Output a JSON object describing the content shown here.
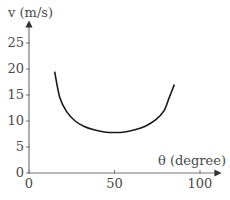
{
  "chart_data": {
    "type": "line",
    "title": "",
    "xlabel": "θ (degree)",
    "ylabel": "v (m/s)",
    "xlim": [
      0,
      100
    ],
    "ylim": [
      0,
      28
    ],
    "x_ticks": [
      "0",
      "50",
      "100"
    ],
    "y_ticks": [
      "0",
      "5",
      "10",
      "15",
      "20",
      "25"
    ],
    "grid": false,
    "legend": null,
    "series": [
      {
        "name": "v vs θ",
        "x": [
          15,
          18,
          22,
          27,
          32,
          38,
          44,
          50,
          56,
          62,
          68,
          74,
          79,
          82,
          85
        ],
        "y": [
          19.5,
          14.5,
          11.8,
          10.0,
          9.0,
          8.3,
          7.9,
          7.8,
          7.9,
          8.3,
          9.0,
          10.2,
          12.0,
          14.5,
          17.0
        ]
      }
    ],
    "line_color": "#1a1a1a",
    "axis_color": "#777777"
  }
}
